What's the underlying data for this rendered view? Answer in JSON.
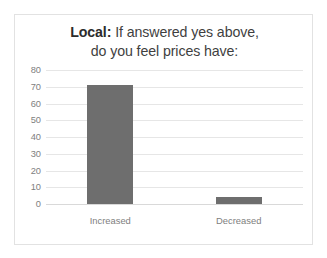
{
  "chart_data": {
    "type": "bar",
    "title": "Local: If answered yes above, do you feel prices have:",
    "title_lines": [
      {
        "bold_prefix": "Local:",
        "rest": " If answered yes above,"
      },
      {
        "bold_prefix": "",
        "rest": "do you feel prices have:"
      }
    ],
    "categories": [
      "Increased",
      "Decreased"
    ],
    "values": [
      71,
      4
    ],
    "series": [
      {
        "name": "Responses",
        "values": [
          71,
          4
        ]
      }
    ],
    "xlabel": "",
    "ylabel": "",
    "ylim": [
      0,
      80
    ],
    "ytick_step": 10,
    "yticks": [
      80,
      70,
      60,
      50,
      40,
      30,
      20,
      10,
      0
    ],
    "grid": true,
    "legend": false,
    "legend_position": "none",
    "bar_color": "#6e6e6e",
    "gridline_color": "#e6e6e6",
    "tick_label_color": "#808080",
    "title_color": "#3f3f3f",
    "frame_border_color": "#e2e2e2",
    "background_color": "#ffffff"
  }
}
